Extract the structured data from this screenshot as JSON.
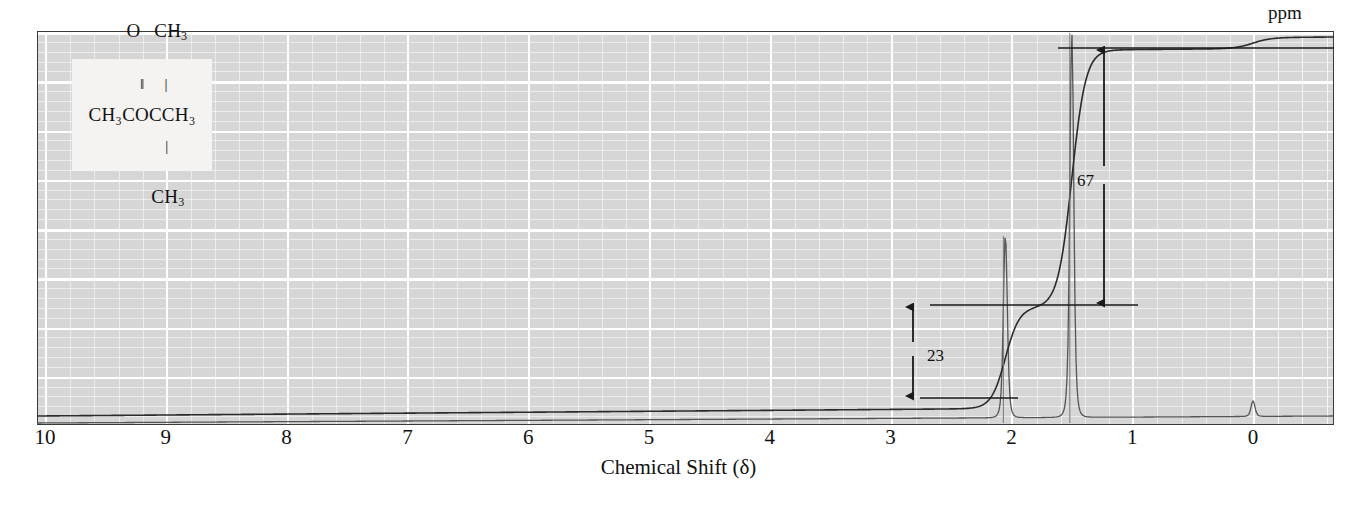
{
  "figure": {
    "kind": "nmr-spectrum",
    "axis_title": "Chemical Shift (δ)",
    "unit_label": "ppm"
  },
  "structure": {
    "name": "methyl-tert-butyl-ketone",
    "line_o": "O",
    "line_ch3_top": "CH",
    "line_ch3_top_sub": "3",
    "bond_double": "‖",
    "bond_single_top": "|",
    "backbone": "CH₃COCCH₃",
    "bond_single_bottom": "|",
    "line_ch3_bottom": "CH",
    "line_ch3_bottom_sub": "3"
  },
  "integrals": [
    {
      "name": "integral-step-23",
      "label": "23",
      "value": 23,
      "label_x": 938,
      "label_y": 350,
      "arrow_x": 913,
      "top_y": 305,
      "bottom_y": 398,
      "ref_line_x1": 930,
      "ref_line_x2": 1138
    },
    {
      "name": "integral-step-67",
      "label": "67",
      "value": 67,
      "label_x": 1078,
      "label_y": 170,
      "arrow_x": 1104,
      "top_y": 48,
      "bottom_y": 305,
      "ref_line_x1": 1058,
      "ref_line_x2": 1334
    }
  ],
  "chart_data": {
    "type": "line",
    "title": "",
    "subtitle": "",
    "xlabel": "Chemical Shift (δ)",
    "ylabel": "",
    "xlim": [
      10,
      0
    ],
    "ylim": [
      0,
      100
    ],
    "grid": true,
    "legend": "none",
    "x_ticks": [
      10,
      9,
      8,
      7,
      6,
      5,
      4,
      3,
      2,
      1,
      0
    ],
    "x_tick_labels": [
      "10",
      "9",
      "8",
      "7",
      "6",
      "5",
      "4",
      "3",
      "2",
      "1",
      "0"
    ],
    "x_unit": "ppm",
    "axis_direction": "decreasing-left-to-right",
    "annotations": [
      {
        "text": "23",
        "type": "integral-step-height",
        "at_ppm": 2.0
      },
      {
        "text": "67",
        "type": "integral-step-height",
        "at_ppm": 1.5
      }
    ],
    "series": [
      {
        "name": "spectrum",
        "kind": "nmr-trace",
        "baseline_level": 2,
        "peaks": [
          {
            "ppm": 2.05,
            "relative_height": 96,
            "assignment": "CH3 C=O",
            "integration": 23,
            "width_ppm": 0.022
          },
          {
            "ppm": 1.5,
            "relative_height": 100,
            "assignment": "C(CH3)3",
            "integration": 67,
            "width_ppm": 0.02
          },
          {
            "ppm": 0.0,
            "relative_height": 9,
            "assignment": "TMS reference",
            "integration": 0,
            "width_ppm": 0.015
          }
        ]
      },
      {
        "name": "integral-trace",
        "kind": "step-integral",
        "steps": [
          {
            "ppm": 2.05,
            "rise": 23
          },
          {
            "ppm": 1.5,
            "rise": 67
          },
          {
            "ppm": 0.0,
            "rise": 4
          }
        ]
      }
    ],
    "gridlines": {
      "major_vertical_ppm": [
        10,
        9,
        8,
        7,
        6,
        5,
        4,
        3,
        2,
        1,
        0
      ],
      "minor_per_major": 5,
      "major_horizontal_count": 8,
      "minor_horizontal_per_major": 5
    }
  },
  "colors": {
    "plot_background": "#d6d6d6",
    "gridline": "#ffffff",
    "trace": "#2b2b2b",
    "frame": "#3a3a3a",
    "text": "#111111",
    "structure_background": "#f4f3f1"
  }
}
